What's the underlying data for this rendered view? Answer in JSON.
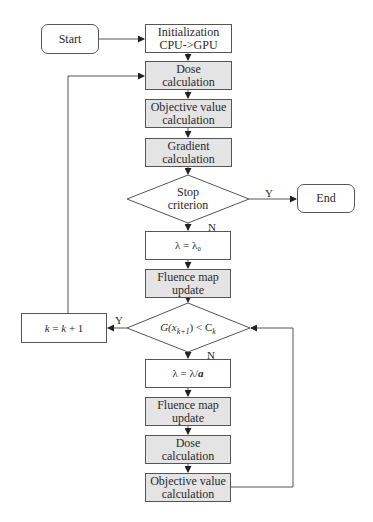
{
  "diagram": {
    "type": "flowchart",
    "colors": {
      "stroke": "#555555",
      "process_fill": "#ffffff",
      "gpu_fill": "#e4e4e4",
      "text": "#2a2a2a"
    },
    "nodes": {
      "start": {
        "label": "Start",
        "shape": "rounded-rect"
      },
      "init": {
        "label": "Initialization\nCPU->GPU",
        "shape": "rect"
      },
      "dose1": {
        "label": "Dose\ncalculation",
        "shape": "rect",
        "shaded": true
      },
      "obj1": {
        "label": "Objective value\ncalculation",
        "shape": "rect",
        "shaded": true
      },
      "grad": {
        "label": "Gradient\ncalculation",
        "shape": "rect",
        "shaded": true
      },
      "stop": {
        "label": "Stop\ncriterion",
        "shape": "diamond"
      },
      "end": {
        "label": "End",
        "shape": "rounded-rect"
      },
      "lambda0": {
        "label": "λ = λ₀",
        "shape": "rect"
      },
      "fluence1": {
        "label": "Fluence map\nupdate",
        "shape": "rect",
        "shaded": true
      },
      "cond": {
        "label": "G(x_{k+1}) < C_k",
        "label_main": "G(x",
        "label_sub": "k+1",
        "label_mid": ") < C",
        "label_sub2": "k",
        "shape": "diamond"
      },
      "kinc": {
        "label_k1": "k",
        "label_eq": " = ",
        "label_k2": "k",
        "label_plus": " + 1",
        "label": "k = k + 1",
        "shape": "rect"
      },
      "lambda_a": {
        "label_left": "λ = λ/",
        "label_a": "a",
        "label": "λ = λ/a",
        "shape": "rect"
      },
      "fluence2": {
        "label": "Fluence map\nupdate",
        "shape": "rect",
        "shaded": true
      },
      "dose2": {
        "label": "Dose\ncalculation",
        "shape": "rect",
        "shaded": true
      },
      "obj2": {
        "label": "Objective value\ncalculation",
        "shape": "rect",
        "shaded": true
      }
    },
    "edge_labels": {
      "stop_yes": "Y",
      "stop_no": "N",
      "cond_yes": "Y",
      "cond_no": "N"
    },
    "edges": [
      [
        "start",
        "init"
      ],
      [
        "init",
        "dose1"
      ],
      [
        "dose1",
        "obj1"
      ],
      [
        "obj1",
        "grad"
      ],
      [
        "grad",
        "stop"
      ],
      [
        "stop",
        "end",
        "Y"
      ],
      [
        "stop",
        "lambda0",
        "N"
      ],
      [
        "lambda0",
        "fluence1"
      ],
      [
        "fluence1",
        "cond"
      ],
      [
        "cond",
        "kinc",
        "Y"
      ],
      [
        "kinc",
        "dose1"
      ],
      [
        "cond",
        "lambda_a",
        "N"
      ],
      [
        "lambda_a",
        "fluence2"
      ],
      [
        "fluence2",
        "dose2"
      ],
      [
        "dose2",
        "obj2"
      ],
      [
        "obj2",
        "cond"
      ]
    ]
  }
}
